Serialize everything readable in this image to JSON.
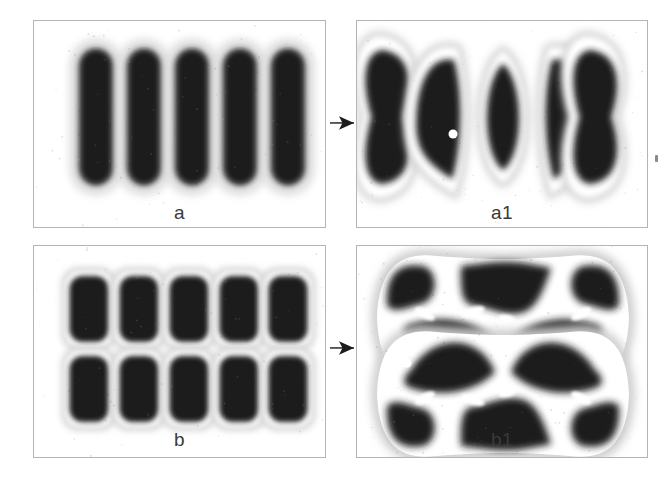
{
  "figure": {
    "background_color": "#ffffff",
    "border_color": "#b4b4b4",
    "ink_color": "#1a1a1a",
    "halo_color": "#ffffff",
    "label_color": "#3a3a3a"
  },
  "panels": [
    {
      "id": "panel-a",
      "label": "a",
      "x": 33,
      "y": 20,
      "w": 293,
      "h": 208,
      "label_y": 181,
      "description": "five vertical dark stadium shapes in a row",
      "shapes": {
        "type": "stadium-row",
        "count": 5,
        "cx": [
          62,
          110,
          158,
          206,
          254
        ],
        "cy": 96,
        "rx": 20,
        "ry": 72
      }
    },
    {
      "id": "panel-a1",
      "label": "a1",
      "x": 356,
      "y": 20,
      "w": 292,
      "h": 208,
      "label_y": 181,
      "description": "five buckled shapes: hourglass, left crescent, lens, right crescent, hourglass",
      "shapes": {
        "type": "buckled-row",
        "count": 5,
        "cx": [
          42,
          92,
          146,
          200,
          250
        ],
        "cy": 96,
        "kinds": [
          "hourglass",
          "crescent-left",
          "lens",
          "crescent-right",
          "hourglass"
        ]
      }
    },
    {
      "id": "panel-b",
      "label": "b",
      "x": 33,
      "y": 245,
      "w": 293,
      "h": 213,
      "label_y": 183,
      "description": "two rows of five dark rounded-rectangle shapes",
      "shapes": {
        "type": "rounded-rect-grid",
        "cols": 5,
        "rows": 2,
        "cx": [
          55,
          105,
          155,
          205,
          254
        ],
        "cy": [
          63,
          143
        ],
        "rx": 22,
        "ry": 36
      }
    },
    {
      "id": "panel-b1",
      "label": "b1",
      "x": 356,
      "y": 245,
      "w": 292,
      "h": 213,
      "label_y": 183,
      "description": "two merged horizontal bands with interlocking dark lobes and white slit voids",
      "shapes": {
        "type": "merged-bands",
        "count": 2,
        "band_cy": [
          72,
          148
        ],
        "band_w": 252,
        "band_h": 68
      }
    }
  ],
  "arrows": [
    {
      "id": "arrow-a-to-a1",
      "x": 330,
      "y": 123,
      "length": 24,
      "direction": "right"
    },
    {
      "id": "arrow-b-to-b1",
      "x": 330,
      "y": 348,
      "length": 24,
      "direction": "right"
    }
  ],
  "markers": [
    {
      "id": "marker-a1-dot",
      "panel": "panel-a1",
      "x": 96,
      "y": 113,
      "r": 4.5,
      "color": "#ffffff"
    },
    {
      "id": "marker-b1-dot",
      "panel": "panel-b1",
      "x": 50,
      "y": 117,
      "r": 4.5,
      "color": "#ffffff"
    }
  ],
  "specks": [
    {
      "id": "speck-right-margin",
      "x": 655,
      "y": 155,
      "w": 3,
      "h": 7
    }
  ]
}
